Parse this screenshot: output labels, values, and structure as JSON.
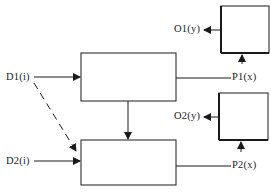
{
  "diagram": {
    "type": "block-diagram",
    "colors": {
      "stroke": "#1a1a1a",
      "background": "#ffffff"
    },
    "inputs": [
      {
        "id": "D1",
        "label": "D1(i)"
      },
      {
        "id": "D2",
        "label": "D2(i)"
      }
    ],
    "process_blocks": [
      {
        "id": "block-1",
        "label": ""
      },
      {
        "id": "block-2",
        "label": ""
      }
    ],
    "output_blocks": [
      {
        "id": "out-block-1",
        "label": ""
      },
      {
        "id": "out-block-2",
        "label": ""
      }
    ],
    "signals": [
      {
        "id": "P1",
        "label": "P1(x)"
      },
      {
        "id": "P2",
        "label": "P2(x)"
      },
      {
        "id": "O1",
        "label": "O1(y)"
      },
      {
        "id": "O2",
        "label": "O2(y)"
      }
    ],
    "connections": [
      {
        "from": "D1",
        "to": "block-1",
        "style": "solid"
      },
      {
        "from": "D1",
        "to": "block-2",
        "style": "dashed"
      },
      {
        "from": "D2",
        "to": "block-2",
        "style": "solid"
      },
      {
        "from": "block-1",
        "to": "block-2",
        "style": "solid"
      },
      {
        "from": "block-1",
        "to": "P1",
        "style": "solid"
      },
      {
        "from": "block-2",
        "to": "P2",
        "style": "solid"
      },
      {
        "from": "P1",
        "to": "out-block-1",
        "style": "solid"
      },
      {
        "from": "P2",
        "to": "out-block-2",
        "style": "solid"
      },
      {
        "from": "out-block-1",
        "to": "O1",
        "style": "solid"
      },
      {
        "from": "out-block-2",
        "to": "O2",
        "style": "solid"
      }
    ]
  }
}
